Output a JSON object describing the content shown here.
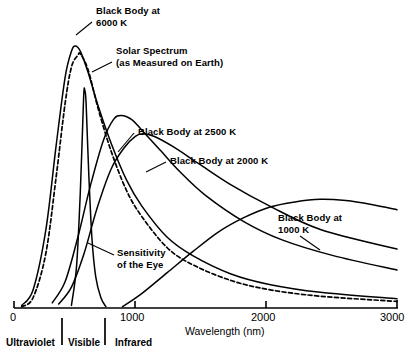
{
  "chart_data": {
    "type": "line",
    "title": "",
    "xlabel": "Wavelength (nm)",
    "ylabel": "",
    "xlim": [
      0,
      3000
    ],
    "ylim": [
      0,
      1.05
    ],
    "grid": false,
    "legend_position": "inline-annotations",
    "xticks": [
      0,
      1000,
      2000,
      3000
    ],
    "xticklabels": [
      "0",
      "1000",
      "2000",
      "3000"
    ],
    "spectral_bands": [
      {
        "name": "Ultraviolet",
        "range_nm": [
          0,
          380
        ]
      },
      {
        "name": "Visible",
        "range_nm": [
          380,
          720
        ]
      },
      {
        "name": "Infrared",
        "range_nm": [
          720,
          3000
        ]
      }
    ],
    "series": [
      {
        "name": "Black Body at 6000 K",
        "style": "solid",
        "peak_nm": 480,
        "x": [
          60,
          150,
          250,
          330,
          400,
          450,
          480,
          520,
          580,
          660,
          760,
          880,
          1000,
          1200,
          1400,
          1700,
          2000,
          2400,
          3000
        ],
        "y": [
          0.01,
          0.07,
          0.3,
          0.62,
          0.88,
          0.98,
          1.0,
          0.98,
          0.9,
          0.77,
          0.63,
          0.49,
          0.39,
          0.27,
          0.2,
          0.13,
          0.09,
          0.06,
          0.035
        ]
      },
      {
        "name": "Solar Spectrum (as Measured on Earth)",
        "style": "dashed",
        "peak_nm": 520,
        "x": [
          60,
          150,
          250,
          330,
          400,
          450,
          500,
          520,
          580,
          660,
          760,
          880,
          1000,
          1200,
          1400,
          1700,
          2000,
          2400,
          3000
        ],
        "y": [
          0.005,
          0.04,
          0.21,
          0.5,
          0.78,
          0.92,
          0.965,
          0.97,
          0.91,
          0.76,
          0.6,
          0.45,
          0.35,
          0.23,
          0.165,
          0.105,
          0.07,
          0.045,
          0.025
        ]
      },
      {
        "name": "Black Body at 2500 K",
        "style": "solid",
        "peak_nm": 840,
        "x": [
          300,
          400,
          500,
          600,
          700,
          780,
          840,
          920,
          1000,
          1150,
          1300,
          1500,
          1800,
          2100,
          2500,
          3000
        ],
        "y": [
          0.02,
          0.1,
          0.27,
          0.47,
          0.64,
          0.72,
          0.735,
          0.72,
          0.68,
          0.6,
          0.52,
          0.43,
          0.33,
          0.26,
          0.2,
          0.145
        ]
      },
      {
        "name": "Black Body at 2000 K",
        "style": "solid",
        "peak_nm": 1010,
        "x": [
          350,
          450,
          550,
          650,
          760,
          860,
          950,
          1010,
          1100,
          1250,
          1450,
          1700,
          2000,
          2400,
          3000
        ],
        "y": [
          0.015,
          0.08,
          0.21,
          0.38,
          0.53,
          0.61,
          0.655,
          0.665,
          0.655,
          0.615,
          0.55,
          0.47,
          0.39,
          0.3,
          0.225
        ]
      },
      {
        "name": "Black Body at 1000 K",
        "style": "solid",
        "peak_nm": 2400,
        "x": [
          850,
          1000,
          1200,
          1400,
          1600,
          1800,
          2000,
          2200,
          2400,
          2600,
          2800,
          3000
        ],
        "y": [
          0.005,
          0.055,
          0.135,
          0.215,
          0.29,
          0.345,
          0.385,
          0.405,
          0.415,
          0.41,
          0.395,
          0.375
        ]
      },
      {
        "name": "Sensitivity of the Eye",
        "style": "solid",
        "peak_nm": 555,
        "x": [
          450,
          490,
          520,
          545,
          555,
          565,
          585,
          610,
          640,
          680,
          720
        ],
        "y": [
          0.01,
          0.16,
          0.45,
          0.8,
          0.83,
          0.78,
          0.52,
          0.27,
          0.12,
          0.04,
          0.005
        ]
      }
    ],
    "annotations": [
      {
        "id": "bb6000",
        "text": "Black Body at\n6000 K",
        "x_px": 96,
        "y_px": 6,
        "leader": [
          [
            92,
            22
          ],
          [
            76,
            35
          ]
        ]
      },
      {
        "id": "solar",
        "text": "Solar Spectrum\n(as Measured on Earth)",
        "x_px": 116,
        "y_px": 46,
        "leader": [
          [
            112,
            62
          ],
          [
            92,
            72
          ]
        ]
      },
      {
        "id": "bb2500",
        "text": "Black Body at 2500 K",
        "x_px": 138,
        "y_px": 128,
        "leader": [
          [
            134,
            133
          ],
          [
            118,
            152
          ]
        ]
      },
      {
        "id": "bb2000",
        "text": "Black Body at 2000 K",
        "x_px": 170,
        "y_px": 157,
        "leader": [
          [
            166,
            162
          ],
          [
            146,
            172
          ]
        ]
      },
      {
        "id": "bb1000",
        "text": "Black Body at\n1000 K",
        "x_px": 278,
        "y_px": 214,
        "leader": [
          [
            300,
            236
          ],
          [
            320,
            250
          ]
        ]
      },
      {
        "id": "eye",
        "text": "Sensitivity\nof the Eye",
        "x_px": 117,
        "y_px": 249,
        "leader": [
          [
            114,
            255
          ],
          [
            88,
            243
          ]
        ]
      }
    ]
  },
  "axis": {
    "x_title": "Wavelength (nm)",
    "tick_0": "0",
    "tick_1000": "1000",
    "tick_2000": "2000",
    "tick_3000": "3000"
  },
  "bands": {
    "ultraviolet": "Ultraviolet",
    "visible": "Visible",
    "infrared": "Infrared"
  },
  "colors": {
    "line": "#000000",
    "background": "#ffffff",
    "text": "#000000"
  }
}
